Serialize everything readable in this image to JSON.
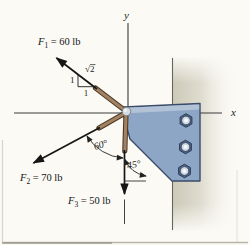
{
  "figure": {
    "axis": {
      "x": "x",
      "y": "y"
    },
    "forces": {
      "f1": {
        "symbol": "F",
        "sub": "1",
        "rest": "= 60 lb"
      },
      "f2": {
        "symbol": "F",
        "sub": "2",
        "rest": "= 70 lb"
      },
      "f3": {
        "symbol": "F",
        "sub": "3",
        "rest": "= 50 lb"
      }
    },
    "angles": {
      "f2_to_vertical": "60°",
      "bracket_edge": "45°"
    },
    "slope_triangle": {
      "rise": "1",
      "run": "1",
      "hypotenuse": "√2"
    },
    "colors": {
      "bracket": "#8ea6c6",
      "bracket_outline": "#3a4c68",
      "bracket_bevel": "#b4c4d8",
      "wall": "#cdcaba",
      "rod": "#a5825f",
      "arrow": "#161616",
      "background": "#fbfaf5"
    }
  }
}
